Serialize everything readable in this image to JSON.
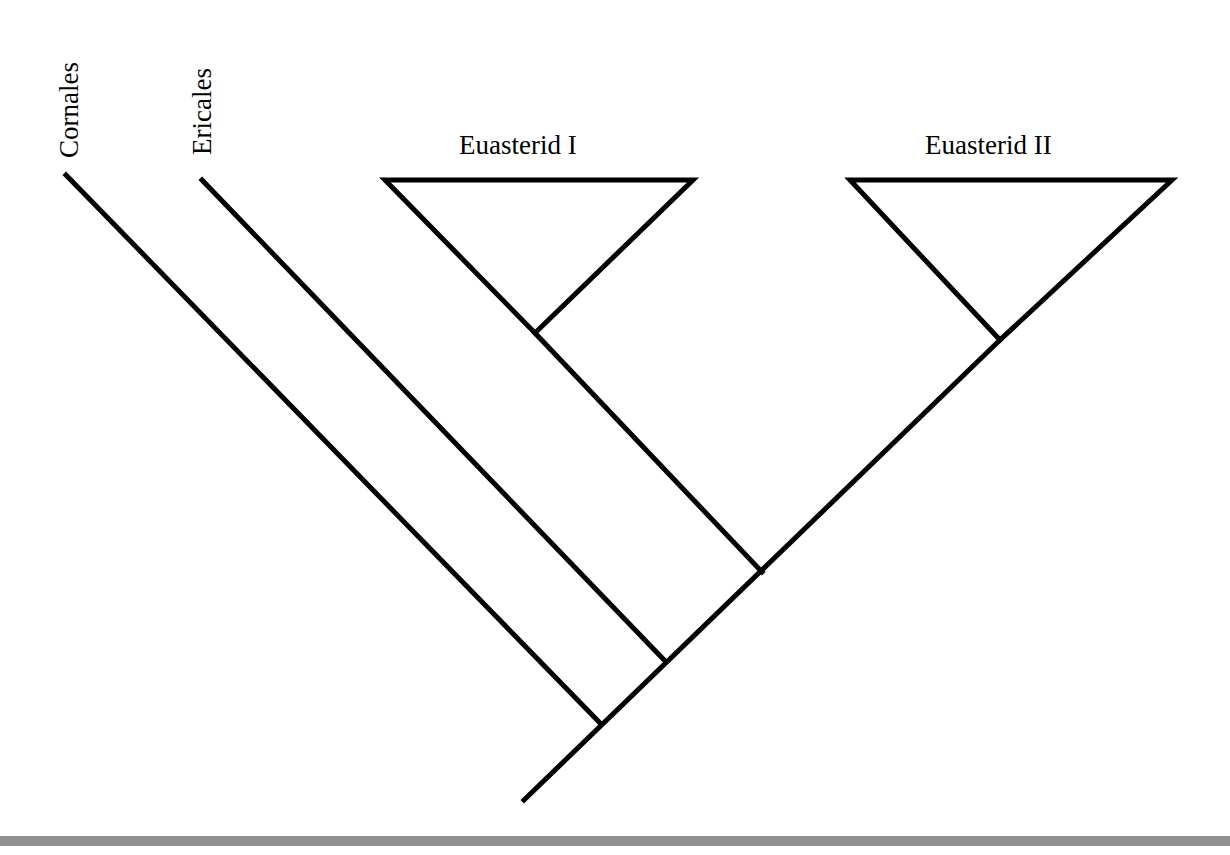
{
  "diagram": {
    "type": "cladogram",
    "taxa": [
      {
        "label": "Cornales",
        "orientation": "vertical"
      },
      {
        "label": "Ericales",
        "orientation": "vertical"
      },
      {
        "label": "Euasterid I",
        "orientation": "horizontal",
        "collapsed_clade": true
      },
      {
        "label": "Euasterid II",
        "orientation": "horizontal",
        "collapsed_clade": true
      }
    ],
    "topology": "(Cornales,(Ericales,(Euasterid I,Euasterid II)))",
    "line_color": "#000000",
    "footer_bar_color": "#8f8f8f"
  }
}
